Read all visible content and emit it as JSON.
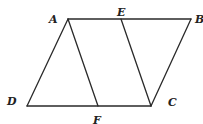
{
  "figure": {
    "points": {
      "A": {
        "label": "A"
      },
      "E": {
        "label": "E"
      },
      "B": {
        "label": "B"
      },
      "D": {
        "label": "D"
      },
      "F": {
        "label": "F"
      },
      "C": {
        "label": "C"
      }
    },
    "segments": [
      {
        "from": "A",
        "to": "B"
      },
      {
        "from": "D",
        "to": "C"
      },
      {
        "from": "A",
        "to": "D"
      },
      {
        "from": "B",
        "to": "C"
      },
      {
        "from": "A",
        "to": "F"
      },
      {
        "from": "E",
        "to": "C"
      }
    ]
  }
}
